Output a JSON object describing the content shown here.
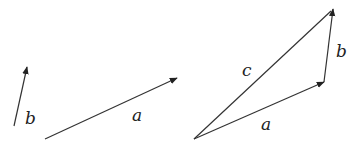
{
  "diagram": {
    "left_panel": {
      "vectors": [
        {
          "name": "b",
          "label": "b",
          "from": [
            14,
            126
          ],
          "to": [
            27,
            67
          ],
          "label_pos": [
            25,
            124
          ]
        },
        {
          "name": "a",
          "label": "a",
          "from": [
            45,
            139
          ],
          "to": [
            177,
            78
          ],
          "label_pos": [
            132,
            121
          ]
        }
      ]
    },
    "right_panel": {
      "vectors": [
        {
          "name": "a",
          "label": "a",
          "from": [
            194,
            139
          ],
          "to": [
            324,
            82
          ],
          "label_pos": [
            261,
            130
          ]
        },
        {
          "name": "b",
          "label": "b",
          "from": [
            324,
            82
          ],
          "to": [
            333,
            9
          ],
          "label_pos": [
            336,
            57
          ]
        },
        {
          "name": "c",
          "label": "c",
          "from": [
            194,
            139
          ],
          "to": [
            333,
            9
          ],
          "label_pos": [
            242,
            76
          ],
          "arrowhead": false
        }
      ]
    },
    "colors": {
      "stroke": "#333333",
      "text": "#222222",
      "background": "#ffffff"
    }
  }
}
